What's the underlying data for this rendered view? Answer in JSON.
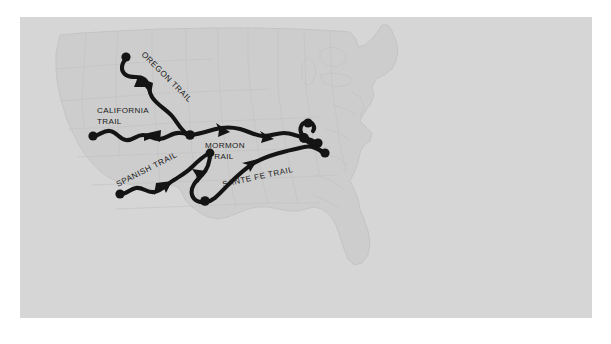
{
  "figure": {
    "kind": "historical-map",
    "region": "United States",
    "panel_background_color": "#d6d6d6",
    "landmass_fill_color": "#cdcdcd",
    "border_color": "#ffffff",
    "trail_color": "#141414"
  },
  "labels": {
    "oregon_trail": "OREGON TRAIL",
    "california_trail_line1": "CALIFORNIA",
    "california_trail_line2": "TRAIL",
    "mormon_trail_line1": "MORMON",
    "mormon_trail_line2": "TRAIL",
    "spanish_trail": "SPANISH  TRAIL",
    "santa_fe_trail": "SANTE FE TRAIL"
  },
  "trails": [
    {
      "id": "oregon-trail",
      "name": "OREGON TRAIL",
      "label_rotation_deg": 45,
      "west_terminus": [
        106,
        40
      ],
      "east_junction": [
        170,
        118
      ],
      "has_arrowhead": true,
      "arrow_direction": "northwest"
    },
    {
      "id": "california-trail",
      "name": "CALIFORNIA TRAIL",
      "label_rotation_deg": 0,
      "west_terminus": [
        73,
        119
      ],
      "east_junction": [
        170,
        118
      ],
      "has_arrowhead": true,
      "arrow_direction": "west"
    },
    {
      "id": "mormon-trail",
      "name": "MORMON TRAIL",
      "label_rotation_deg": 0,
      "west_junction": [
        170,
        118
      ],
      "east_terminus": [
        305,
        126
      ],
      "has_arrowhead": true,
      "arrow_direction": "west"
    },
    {
      "id": "spanish-trail",
      "name": "SPANISH TRAIL",
      "label_rotation_deg": -27,
      "west_terminus": [
        100,
        177
      ],
      "east_junction": [
        196,
        139
      ],
      "has_arrowhead": true,
      "arrow_direction": "west"
    },
    {
      "id": "sante-fe-trail",
      "name": "SANTE FE TRAIL",
      "label_rotation_deg": -12,
      "west_junction": [
        196,
        139
      ],
      "east_terminus": [
        300,
        136
      ],
      "has_arrowhead": true,
      "arrow_direction": "west"
    }
  ],
  "terminus_markers": [
    {
      "name": "oregon-west-terminus",
      "x": 106,
      "y": 40
    },
    {
      "name": "california-west-terminus",
      "x": 73,
      "y": 119
    },
    {
      "name": "central-junction",
      "x": 170,
      "y": 118
    },
    {
      "name": "spanish-southwest-terminus",
      "x": 100,
      "y": 177
    },
    {
      "name": "santa-fe-south-bend",
      "x": 185,
      "y": 184
    },
    {
      "name": "eastern-terminus-north",
      "x": 287,
      "y": 118
    },
    {
      "name": "eastern-terminus-mid",
      "x": 298,
      "y": 126
    },
    {
      "name": "eastern-terminus-south",
      "x": 305,
      "y": 136
    }
  ]
}
